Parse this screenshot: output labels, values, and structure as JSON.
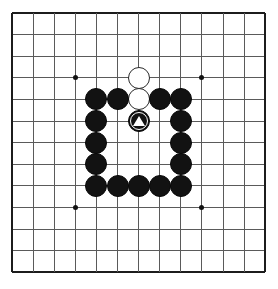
{
  "diagram": {
    "kind": "go-board-diagram",
    "board_size": 13,
    "background_color": "#ffffff",
    "line_color": "#5a5a5a",
    "edge_color": "#1c1c1c",
    "black_stone_color": "#121212",
    "white_stone_color": "#ffffff",
    "mark_color": "#ffffff",
    "geometry": {
      "origin_x": 12,
      "origin_y": 13,
      "spacing_x": 21.1,
      "spacing_y": 21.6,
      "stone_diameter": 22
    },
    "star_points": [
      {
        "col": 3,
        "row": 3
      },
      {
        "col": 9,
        "row": 3
      },
      {
        "col": 3,
        "row": 9
      },
      {
        "col": 9,
        "row": 9
      }
    ],
    "column_labels": [
      "A",
      "B",
      "C",
      "D",
      "E",
      "F",
      "G",
      "H",
      "J",
      "K",
      "L",
      "M",
      "N"
    ],
    "row_labels": [
      "13",
      "12",
      "11",
      "10",
      "9",
      "8",
      "7",
      "6",
      "5",
      "4",
      "3",
      "2",
      "1"
    ],
    "stones": [
      {
        "id": "w1",
        "color": "white",
        "col": 6,
        "row": 3,
        "marked": false
      },
      {
        "id": "w2",
        "color": "white",
        "col": 6,
        "row": 4,
        "marked": false
      },
      {
        "id": "b1",
        "color": "black",
        "col": 4,
        "row": 4,
        "marked": false
      },
      {
        "id": "b2",
        "color": "black",
        "col": 5,
        "row": 4,
        "marked": false
      },
      {
        "id": "b3",
        "color": "black",
        "col": 7,
        "row": 4,
        "marked": false
      },
      {
        "id": "b4",
        "color": "black",
        "col": 8,
        "row": 4,
        "marked": false
      },
      {
        "id": "b5",
        "color": "black",
        "col": 4,
        "row": 5,
        "marked": false
      },
      {
        "id": "b6",
        "color": "black",
        "col": 6,
        "row": 5,
        "marked": true
      },
      {
        "id": "b7",
        "color": "black",
        "col": 8,
        "row": 5,
        "marked": false
      },
      {
        "id": "b8",
        "color": "black",
        "col": 4,
        "row": 6,
        "marked": false
      },
      {
        "id": "b9",
        "color": "black",
        "col": 8,
        "row": 6,
        "marked": false
      },
      {
        "id": "b10",
        "color": "black",
        "col": 4,
        "row": 7,
        "marked": false
      },
      {
        "id": "b11",
        "color": "black",
        "col": 8,
        "row": 7,
        "marked": false
      },
      {
        "id": "b12",
        "color": "black",
        "col": 4,
        "row": 8,
        "marked": false
      },
      {
        "id": "b13",
        "color": "black",
        "col": 5,
        "row": 8,
        "marked": false
      },
      {
        "id": "b14",
        "color": "black",
        "col": 6,
        "row": 8,
        "marked": false
      },
      {
        "id": "b15",
        "color": "black",
        "col": 7,
        "row": 8,
        "marked": false
      },
      {
        "id": "b16",
        "color": "black",
        "col": 8,
        "row": 8,
        "marked": false
      }
    ],
    "marks": [
      {
        "type": "triangle",
        "col": 6,
        "row": 5,
        "on_color": "black",
        "mark_color": "#ffffff"
      }
    ],
    "counts": {
      "black_stones": 16,
      "white_stones": 2,
      "marked_stones": 1
    }
  }
}
